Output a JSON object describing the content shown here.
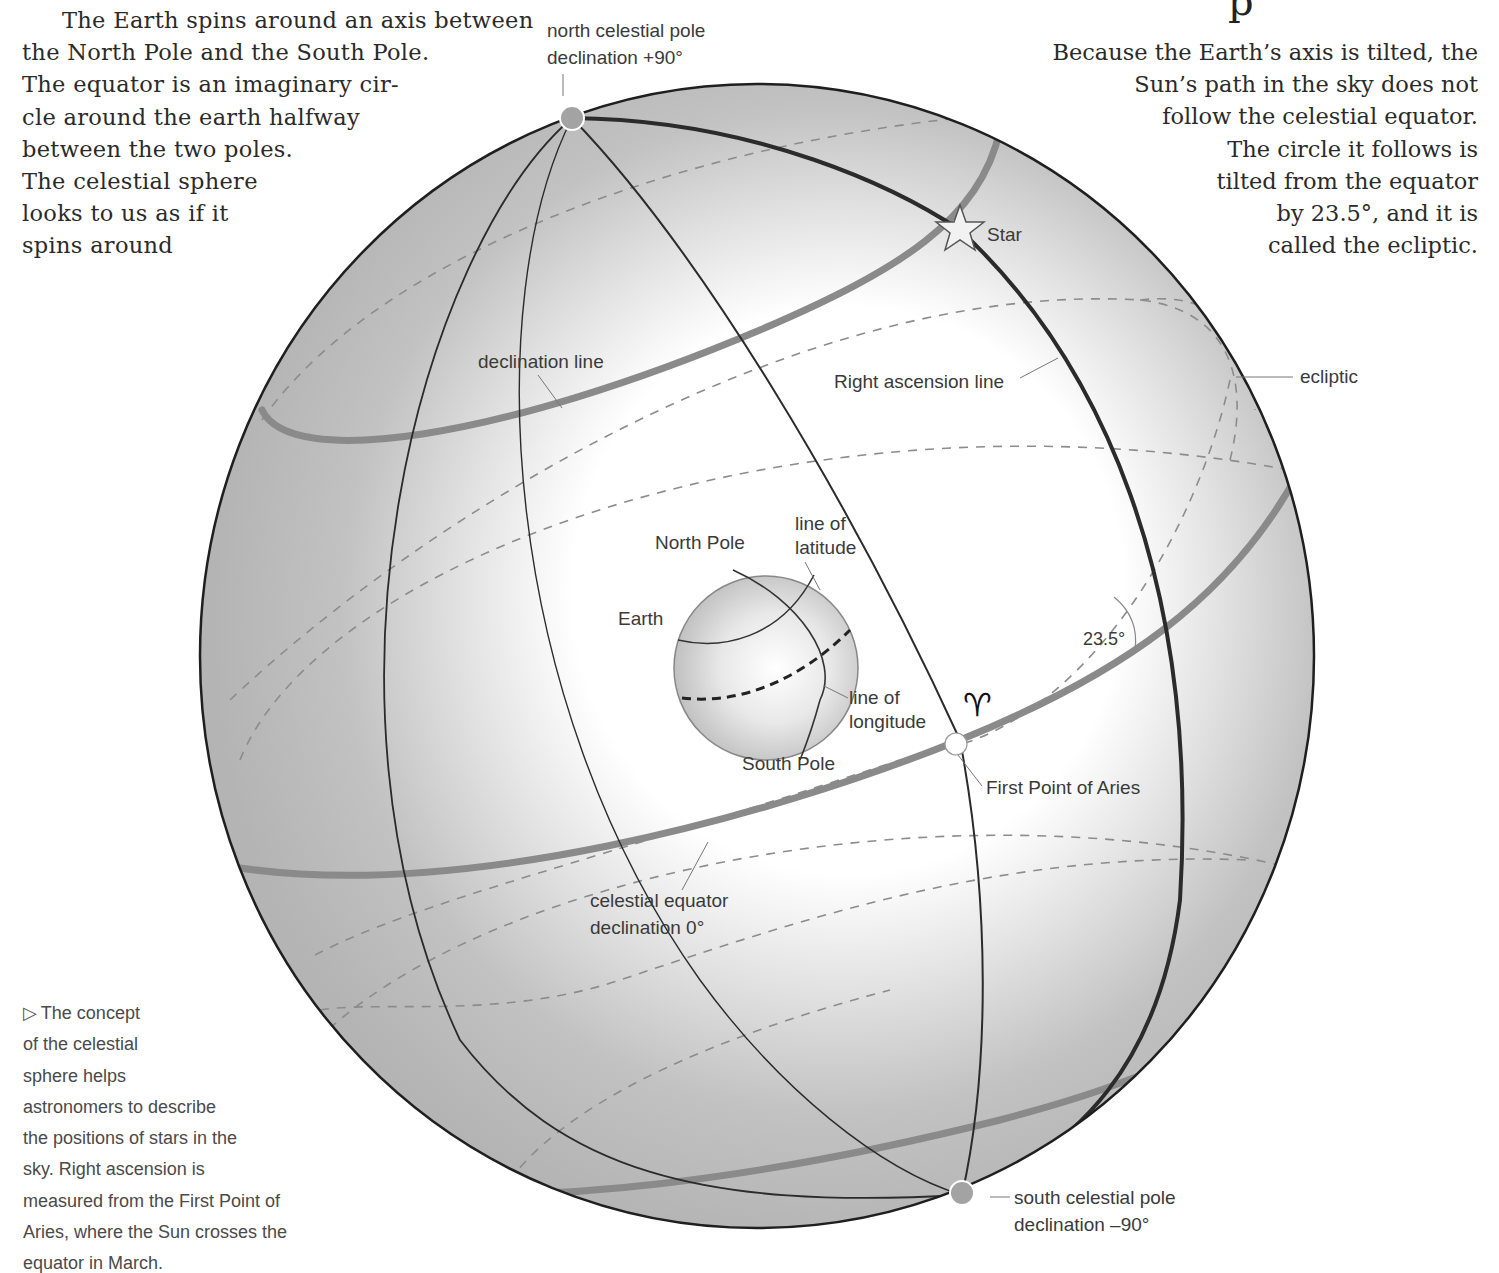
{
  "heading_fragment": "p",
  "intro_left": {
    "lines": [
      "The Earth spins around an axis between",
      "the North Pole and the South Pole.",
      "The equator is an imaginary cir-",
      "cle around the earth halfway",
      "between the two poles.",
      "The celestial sphere",
      "looks to us as if it",
      "spins around"
    ]
  },
  "intro_right": {
    "lines": [
      "Because the Earth’s axis is tilted, the",
      "Sun’s path in the sky does not",
      "follow the celestial equator.",
      "The circle it follows is",
      "tilted from the equator",
      "by 23.5°, and it is",
      "called the ecliptic."
    ]
  },
  "caption": {
    "marker": "▷",
    "lines": [
      "The concept",
      "of the celestial",
      "sphere helps",
      "astronomers to describe",
      "the positions of stars in the",
      "sky. Right ascension is",
      "measured from the First Point of",
      "Aries, where the Sun crosses the",
      "equator in March."
    ]
  },
  "labels": {
    "north_celestial_pole": [
      "north celestial pole",
      "declination +90°"
    ],
    "south_celestial_pole": [
      "south celestial pole",
      "declination –90°"
    ],
    "star": "Star",
    "declination_line": "declination line",
    "right_ascension_line": "Right ascension line",
    "ecliptic": "ecliptic",
    "north_pole": "North Pole",
    "line_of_latitude": [
      "line of",
      "latitude"
    ],
    "earth": "Earth",
    "line_of_longitude": [
      "line of",
      "longitude"
    ],
    "south_pole": "South Pole",
    "angle": "23.5°",
    "aries_symbol": "♈︎",
    "first_point_of_aries": "First Point of Aries",
    "celestial_equator": [
      "celestial equator",
      "declination 0°"
    ]
  },
  "colors": {
    "sphere_shade": "#b9b9b9",
    "sphere_highlight": "#ffffff",
    "band_gray": "#8a8a8a",
    "line_dark": "#2b2b2b",
    "dash_gray": "#8c8c8c",
    "pole_dot": "#a3a3a3"
  }
}
